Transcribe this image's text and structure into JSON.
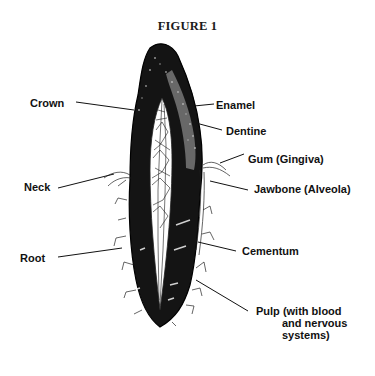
{
  "figure": {
    "title": "FIGURE 1"
  },
  "labels": {
    "crown": "Crown",
    "enamel": "Enamel",
    "dentine": "Dentine",
    "gum": "Gum (Gingiva)",
    "neck": "Neck",
    "jawbone": "Jawbone (Alveola)",
    "root": "Root",
    "cementum": "Cementum",
    "pulp_line1": "Pulp (with blood",
    "pulp_line2": "and nervous",
    "pulp_line3": "systems)"
  },
  "colors": {
    "ink": "#111111",
    "paper": "#ffffff"
  }
}
